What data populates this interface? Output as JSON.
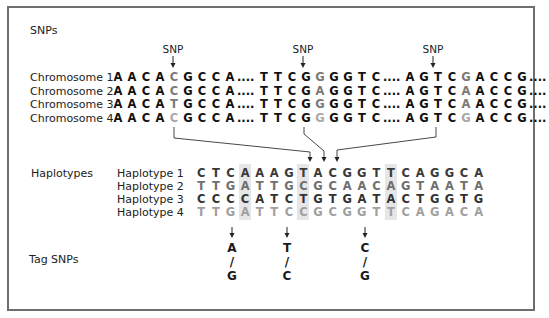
{
  "sections": {
    "snps": "SNPs",
    "haplotypes": "Haplotypes",
    "tag_snps": "Tag SNPs"
  },
  "snp_markers": [
    {
      "label": "SNP",
      "x": 173
    },
    {
      "label": "SNP",
      "x": 303
    },
    {
      "label": "SNP",
      "x": 433
    }
  ],
  "chromosomes": [
    {
      "label": "Chromosome 1",
      "segments": [
        "AACA",
        "C",
        "GCCA....TTCG",
        "G",
        "GGTC....AGTC",
        "G",
        "ACCG...."
      ],
      "snp_colors": [
        "#7a7a7a",
        "#7a7a7a",
        "#7a7a7a"
      ],
      "base_color": "#111111"
    },
    {
      "label": "Chromosome 2",
      "segments": [
        "AACA",
        "C",
        "GCCA....TTCG",
        "A",
        "GGTC....AGTC",
        "A",
        "ACCG...."
      ],
      "snp_colors": [
        "#7a7a7a",
        "#7a7a7a",
        "#7a7a7a"
      ],
      "base_color": "#111111"
    },
    {
      "label": "Chromosome 3",
      "segments": [
        "AACA",
        "T",
        "GCCA....TTCG",
        "G",
        "GGTC....AGTC",
        "A",
        "ACCG...."
      ],
      "snp_colors": [
        "#7a7a7a",
        "#7a7a7a",
        "#7a7a7a"
      ],
      "base_color": "#111111"
    },
    {
      "label": "Chromosome 4",
      "segments": [
        "AACA",
        "C",
        "GCCA....TTCG",
        "G",
        "GGTC....AGTC",
        "G",
        "ACCG...."
      ],
      "snp_colors": [
        "#a8a8a8",
        "#a8a8a8",
        "#a8a8a8"
      ],
      "base_color": "#111111"
    }
  ],
  "haplotypes": [
    {
      "label": "Haplotype 1",
      "sequence": "CTCAAAGTACGGTTCAGGCA",
      "color": "#3a3a3a"
    },
    {
      "label": "Haplotype 2",
      "sequence": "TTGATTGCGCAACAGTAATA",
      "color": "#707070"
    },
    {
      "label": "Haplotype 3",
      "sequence": "CCCCATCTGTGATACTGGTG",
      "color": "#333333"
    },
    {
      "label": "Haplotype 4",
      "sequence": "TTGATTCCGCGGTTCAGACA",
      "color": "#a0a0a0"
    }
  ],
  "highlighted_columns": [
    3,
    7,
    13
  ],
  "tag_snps": [
    {
      "top": "A",
      "sep": "/",
      "bottom": "G",
      "x": 232
    },
    {
      "top": "T",
      "sep": "/",
      "bottom": "C",
      "x": 287
    },
    {
      "top": "C",
      "sep": "/",
      "bottom": "G",
      "x": 365
    }
  ],
  "colors": {
    "border": "#6e6e6e",
    "band": "#e6e6e6",
    "arrow": "#222222"
  }
}
